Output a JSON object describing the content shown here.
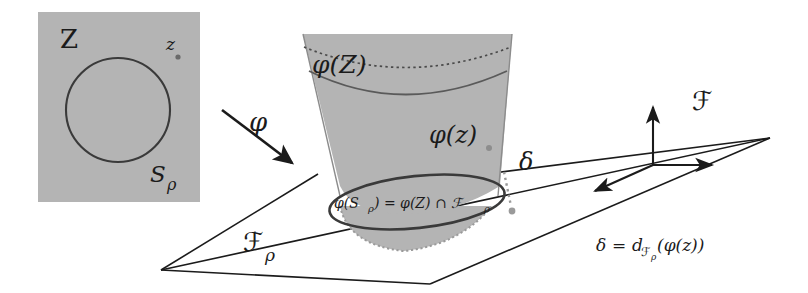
{
  "figure": {
    "background_color": "#ffffff",
    "ink_color": "#1b1b1b",
    "shade_color": "#b3b3b3"
  },
  "domain_panel": {
    "name": "source-domain-square",
    "fill": "#b4b4b4",
    "labels": {
      "space": "Z",
      "point": "z",
      "sphere": "S",
      "sphere_subscript": "ρ"
    }
  },
  "map_arrow": {
    "label": "φ",
    "direction": "down-right"
  },
  "cone": {
    "name": "image-paraboloid",
    "fill": "#b4b4b4",
    "labels": {
      "image_of_Z": "φ(Z)",
      "image_of_z": "φ(z)",
      "intersection": "φ(S",
      "intersection_sub": "ρ",
      "intersection_rest": ") = φ(Z) ∩ ℱ",
      "intersection_rest_sub": "ρ",
      "intersection_full": "φ(S_ρ) = φ(Z) ∩ ℱ_ρ"
    }
  },
  "plane": {
    "name": "frame-plane",
    "label": "ℱ",
    "label_subscript": "ρ"
  },
  "frame_axes": {
    "label": "ℱ",
    "axes": [
      "up",
      "right",
      "down-left"
    ]
  },
  "distance": {
    "symbol": "δ",
    "equation_lhs": "δ",
    "equation_eq": "=",
    "equation_rhs_fn": "d",
    "equation_rhs_sub": "ℱ",
    "equation_rhs_sub2": "ρ",
    "equation_rhs_arg": "(φ(z))",
    "equation_full": "δ = d_{ℱ_ρ}(φ(z))"
  }
}
